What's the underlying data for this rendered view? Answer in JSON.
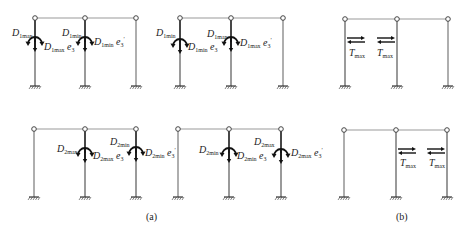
{
  "figure": {
    "captions": {
      "a": "(a)",
      "b": "(b)"
    },
    "colors": {
      "beam": "#9a9a9a",
      "column": "#9a9a9a",
      "loaded_column": "#333333",
      "text": "#222222"
    },
    "panels": [
      {
        "id": "a-top-left",
        "labels": [
          {
            "main": "D",
            "sub": "1max",
            "suffix": ""
          },
          {
            "main": "D",
            "sub": "1max",
            "suffix": "e₃"
          },
          {
            "main": "D",
            "sub": "1min",
            "suffix": ""
          },
          {
            "main": "D",
            "sub": "1min",
            "suffix": "e₃′"
          }
        ]
      },
      {
        "id": "a-top-right",
        "labels": [
          {
            "main": "D",
            "sub": "1min",
            "suffix": ""
          },
          {
            "main": "D",
            "sub": "1min",
            "suffix": "e₃"
          },
          {
            "main": "D",
            "sub": "1max",
            "suffix": ""
          },
          {
            "main": "D",
            "sub": "1max",
            "suffix": "e₃′"
          }
        ]
      },
      {
        "id": "b-top",
        "labels": [
          {
            "main": "T",
            "sub": "max"
          },
          {
            "main": "T",
            "sub": "max"
          }
        ]
      },
      {
        "id": "a-bottom-left",
        "labels": [
          {
            "main": "D",
            "sub": "2max",
            "suffix": ""
          },
          {
            "main": "D",
            "sub": "2max",
            "suffix": "e₃"
          },
          {
            "main": "D",
            "sub": "2min",
            "suffix": ""
          },
          {
            "main": "D",
            "sub": "2min",
            "suffix": "e₃′"
          }
        ]
      },
      {
        "id": "a-bottom-right",
        "labels": [
          {
            "main": "D",
            "sub": "2min",
            "suffix": ""
          },
          {
            "main": "D",
            "sub": "2min",
            "suffix": "e₃"
          },
          {
            "main": "D",
            "sub": "2max",
            "suffix": ""
          },
          {
            "main": "D",
            "sub": "2max",
            "suffix": "e₃′"
          }
        ]
      },
      {
        "id": "b-bottom",
        "labels": [
          {
            "main": "T",
            "sub": "max"
          },
          {
            "main": "T",
            "sub": "max"
          }
        ]
      }
    ]
  }
}
